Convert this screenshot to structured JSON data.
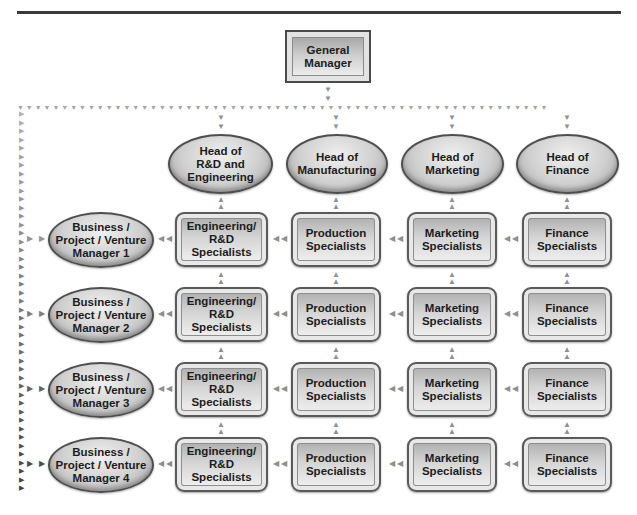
{
  "header": {
    "title_fragment": "p   y"
  },
  "diagram": {
    "top": {
      "label": "General\nManager"
    },
    "functional_heads": [
      {
        "label": "Head of\nR&D and\nEngineering"
      },
      {
        "label": "Head of\nManufacturing"
      },
      {
        "label": "Head of\nMarketing"
      },
      {
        "label": "Head of\nFinance"
      }
    ],
    "rows": [
      {
        "manager": "Business /\nProject / Venture\nManager 1",
        "specialists": [
          "Engineering/\nR&D\nSpecialists",
          "Production\nSpecialists",
          "Marketing\nSpecialists",
          "Finance\nSpecialists"
        ]
      },
      {
        "manager": "Business /\nProject / Venture\nManager 2",
        "specialists": [
          "Engineering/\nR&D\nSpecialists",
          "Production\nSpecialists",
          "Marketing\nSpecialists",
          "Finance\nSpecialists"
        ]
      },
      {
        "manager": "Business /\nProject / Venture\nManager 3",
        "specialists": [
          "Engineering/\nR&D\nSpecialists",
          "Production\nSpecialists",
          "Marketing\nSpecialists",
          "Finance\nSpecialists"
        ]
      },
      {
        "manager": "Business /\nProject / Venture\nManager 4",
        "specialists": [
          "Engineering/\nR&D\nSpecialists",
          "Production\nSpecialists",
          "Marketing\nSpecialists",
          "Finance\nSpecialists"
        ]
      }
    ],
    "arrow_glyphs": {
      "down": "▼",
      "up": "▲",
      "left": "◀",
      "right": "▶"
    },
    "colors": {
      "node_border": "#4e4e4e",
      "node_fill_light": "#f3f3f3",
      "node_fill_dark": "#a9a9a9",
      "arrow_light": "#b0b0b0",
      "arrow_dark": "#555555",
      "rule": "#3a3a3a"
    }
  }
}
